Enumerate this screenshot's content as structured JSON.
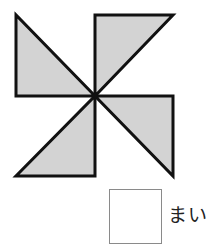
{
  "figure": {
    "triangle_count": 4,
    "fill_color": "#d3d3d3",
    "stroke_color": "#111111"
  },
  "answer": {
    "value": "",
    "unit_label": "まい"
  }
}
